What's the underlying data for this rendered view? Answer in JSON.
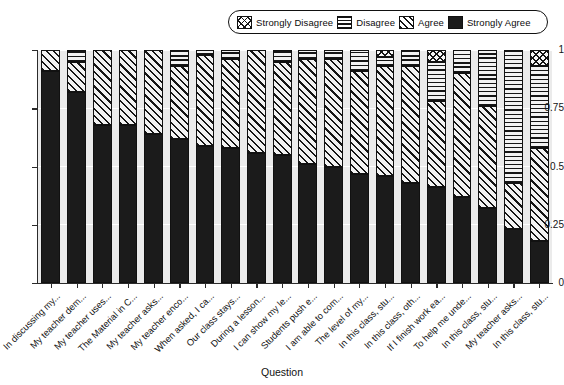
{
  "legend": {
    "position": "top",
    "items": [
      {
        "key": "strongly_disagree",
        "label": "Strongly Disagree",
        "pattern": "crosshatch"
      },
      {
        "key": "disagree",
        "label": "Disagree",
        "pattern": "horizontal-lines"
      },
      {
        "key": "agree",
        "label": "Agree",
        "pattern": "diagonal-hatch"
      },
      {
        "key": "strongly_agree",
        "label": "Strongly Agree",
        "pattern": "solid-black"
      }
    ]
  },
  "axes": {
    "x": {
      "title": "Question"
    },
    "y": {
      "title": "",
      "ticks": [
        "0",
        "0.25",
        "0.5",
        "0.75",
        "1"
      ],
      "values": [
        0,
        0.25,
        0.5,
        0.75,
        1
      ]
    }
  },
  "colors": {
    "plot_background": "#ebebeb",
    "gridline": "#ffffff",
    "axis": "#2b2b2b",
    "strongly_agree": "#1b1b1b",
    "ink": "#151515",
    "page_background": "#ffffff"
  },
  "chart_data": {
    "type": "bar",
    "subtype": "stacked-bar-100-percent",
    "title": "",
    "xlabel": "Question",
    "ylabel": "",
    "ylim": [
      0,
      1
    ],
    "yticks": [
      0,
      0.25,
      0.5,
      0.75,
      1
    ],
    "grid": true,
    "legend_position": "top",
    "categories": [
      "In discussing my...",
      "My teacher dem...",
      "My teacher uses...",
      "The Material in C...",
      "My teacher asks...",
      "My teacher enco...",
      "When asked, I ca...",
      "Our class stays...",
      "During a lesson...",
      "I can show my le...",
      "Students push e...",
      "I am able to com...",
      "The level of my...",
      "In this class, stu...",
      "In this class, oth...",
      "If I finish work ea...",
      "To help me unde...",
      "In this class, stu...",
      "My teacher asks...",
      "In this class, stu..."
    ],
    "series": [
      {
        "name": "Strongly Agree",
        "values": [
          0.91,
          0.82,
          0.68,
          0.68,
          0.64,
          0.62,
          0.59,
          0.58,
          0.56,
          0.55,
          0.51,
          0.5,
          0.47,
          0.46,
          0.43,
          0.41,
          0.37,
          0.32,
          0.23,
          0.18
        ]
      },
      {
        "name": "Agree",
        "values": [
          0.09,
          0.13,
          0.32,
          0.32,
          0.36,
          0.31,
          0.39,
          0.38,
          0.44,
          0.4,
          0.45,
          0.46,
          0.44,
          0.47,
          0.5,
          0.37,
          0.53,
          0.44,
          0.2,
          0.4
        ]
      },
      {
        "name": "Disagree",
        "values": [
          0.0,
          0.05,
          0.0,
          0.0,
          0.0,
          0.07,
          0.02,
          0.04,
          0.0,
          0.05,
          0.04,
          0.04,
          0.09,
          0.04,
          0.07,
          0.17,
          0.1,
          0.24,
          0.57,
          0.35
        ]
      },
      {
        "name": "Strongly Disagree",
        "values": [
          0.0,
          0.0,
          0.0,
          0.0,
          0.0,
          0.0,
          0.0,
          0.0,
          0.0,
          0.0,
          0.0,
          0.0,
          0.0,
          0.03,
          0.0,
          0.05,
          0.0,
          0.0,
          0.0,
          0.07
        ]
      }
    ]
  }
}
